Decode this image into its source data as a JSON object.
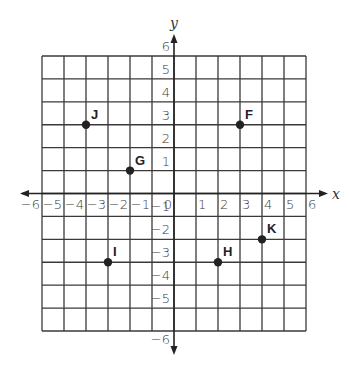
{
  "figure": {
    "type": "coordinate-plane",
    "x_axis": {
      "label": "x",
      "min": -6,
      "max": 6,
      "ticks": [
        "−6",
        "−5",
        "−4",
        "−3",
        "−2",
        "−1",
        "0",
        "1",
        "2",
        "3",
        "4",
        "5",
        "6"
      ]
    },
    "y_axis": {
      "label": "y",
      "min": -6,
      "max": 6,
      "ticks_positive": [
        "1",
        "2",
        "3",
        "4",
        "5",
        "6"
      ],
      "ticks_negative": [
        "−1",
        "−2",
        "−3",
        "−4",
        "−5",
        "−6"
      ]
    },
    "grid": {
      "columns": 12,
      "rows": 12,
      "line_color": "#3a3a3a",
      "background": "#ffffff"
    },
    "points": [
      {
        "label": "J",
        "x": -4,
        "y": 3
      },
      {
        "label": "G",
        "x": -2,
        "y": 1
      },
      {
        "label": "F",
        "x": 3,
        "y": 3
      },
      {
        "label": "I",
        "x": -3,
        "y": -3
      },
      {
        "label": "H",
        "x": 2,
        "y": -3
      },
      {
        "label": "K",
        "x": 4,
        "y": -2
      }
    ],
    "point_color": "#222222"
  }
}
